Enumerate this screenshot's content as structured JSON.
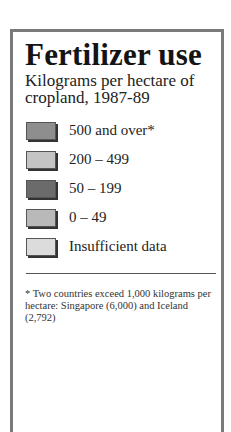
{
  "legend_box": {
    "title": "Fertilizer use",
    "subtitle": "Kilograms per hectare of cropland, 1987-89",
    "items": [
      {
        "label": "500 and over*",
        "color": "#8e8e8e"
      },
      {
        "label": "200 – 499",
        "color": "#c4c4c4"
      },
      {
        "label": "50 – 199",
        "color": "#6b6b6b"
      },
      {
        "label": "0 – 49",
        "color": "#b9b9b9"
      },
      {
        "label": "Insufficient data",
        "color": "#dcdcdc"
      }
    ],
    "footnote": "* Two countries exceed 1,000 kilograms per hectare: Singapore (6,000) and Iceland (2,792)"
  },
  "chart_data": {
    "type": "legend",
    "title": "Fertilizer use",
    "subtitle": "Kilograms per hectare of cropland, 1987-89",
    "categories": [
      "500 and over*",
      "200 – 499",
      "50 – 199",
      "0 – 49",
      "Insufficient data"
    ],
    "colors": [
      "#8e8e8e",
      "#c4c4c4",
      "#6b6b6b",
      "#b9b9b9",
      "#dcdcdc"
    ],
    "annotations": [
      "* Two countries exceed 1,000 kilograms per hectare: Singapore (6,000) and Iceland (2,792)"
    ],
    "notable_values": [
      {
        "country": "Singapore",
        "kg_per_hectare": 6000
      },
      {
        "country": "Iceland",
        "kg_per_hectare": 2792
      }
    ]
  }
}
